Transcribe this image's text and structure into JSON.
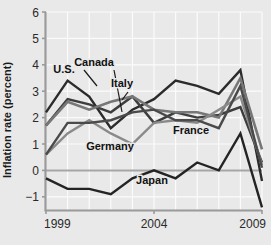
{
  "chart_data": {
    "type": "line",
    "title": "",
    "xlabel": "",
    "ylabel": "Inflation rate (percent)",
    "xlim": [
      1999,
      2009
    ],
    "ylim": [
      -1.5,
      6
    ],
    "yticks": [
      -1,
      0,
      1,
      2,
      3,
      4,
      5,
      6
    ],
    "ytick_labels": [
      "−1",
      "0",
      "1",
      "2",
      "3",
      "4",
      "5",
      "6"
    ],
    "xticks": [
      1999,
      2004,
      2009
    ],
    "xtick_labels": [
      "1999",
      "2004",
      "2009"
    ],
    "grid": true,
    "legend_position": "inline-annotations",
    "x": [
      1999,
      2000,
      2001,
      2002,
      2003,
      2004,
      2005,
      2006,
      2007,
      2008,
      2009
    ],
    "series": [
      {
        "name": "U.S.",
        "color": "#2b2b2b",
        "width": 2.4,
        "values": [
          2.2,
          3.4,
          2.8,
          1.6,
          2.3,
          2.7,
          3.4,
          3.2,
          2.9,
          3.8,
          -0.4
        ]
      },
      {
        "name": "Canada",
        "color": "#3d3d3d",
        "width": 2.4,
        "values": [
          1.7,
          2.7,
          2.5,
          2.2,
          2.8,
          1.8,
          2.2,
          2.0,
          2.1,
          2.4,
          0.3
        ]
      },
      {
        "name": "Italy",
        "color": "#777777",
        "width": 2.6,
        "values": [
          1.7,
          2.6,
          2.3,
          2.6,
          2.8,
          2.3,
          2.2,
          2.2,
          2.0,
          3.5,
          0.8
        ]
      },
      {
        "name": "Germany",
        "color": "#8a8a8a",
        "width": 2.4,
        "values": [
          0.6,
          1.4,
          1.9,
          1.4,
          1.0,
          1.8,
          1.9,
          1.8,
          2.3,
          2.8,
          0.2
        ]
      },
      {
        "name": "France",
        "color": "#4a4a4a",
        "width": 2.4,
        "values": [
          0.6,
          1.8,
          1.8,
          1.9,
          2.2,
          2.3,
          1.9,
          1.9,
          1.6,
          3.2,
          0.1
        ]
      },
      {
        "name": "Japan",
        "color": "#242424",
        "width": 2.4,
        "values": [
          -0.3,
          -0.7,
          -0.7,
          -0.9,
          -0.3,
          0.0,
          -0.3,
          0.3,
          0.0,
          1.4,
          -1.4
        ]
      }
    ],
    "annotations": [
      {
        "text": "U.S.",
        "x": 64,
        "y": 73
      },
      {
        "text": "Canada",
        "x": 94,
        "y": 66
      },
      {
        "text": "Italy",
        "x": 122,
        "y": 87
      },
      {
        "text": "Germany",
        "x": 110,
        "y": 150
      },
      {
        "text": "France",
        "x": 191,
        "y": 134
      },
      {
        "text": "Japan",
        "x": 152,
        "y": 184
      }
    ]
  },
  "axis": {
    "y_title": "Inflation rate (percent)"
  }
}
